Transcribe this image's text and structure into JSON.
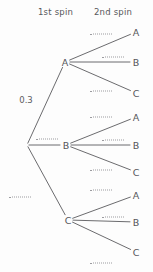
{
  "diagram": {
    "stage_width": 153,
    "stage_height": 272,
    "ink_color": "#5a5a5e",
    "blank_color": "#9b9b9f",
    "background": "#fdfdfd"
  },
  "headers": {
    "first": "1st spin",
    "second": "2nd spin"
  },
  "chart_data": {
    "type": "tree",
    "stage_width": 153,
    "stage_height": 272,
    "levels": [
      "1st spin",
      "2nd spin"
    ],
    "root": {
      "x": 27,
      "y": 145
    },
    "first_spin_nodes": [
      {
        "id": "A1",
        "label": "A",
        "x": 65,
        "y": 62
      },
      {
        "id": "B1",
        "label": "B",
        "x": 66,
        "y": 145
      },
      {
        "id": "C1",
        "label": "C",
        "x": 68,
        "y": 220
      }
    ],
    "second_spin_nodes": [
      {
        "id": "A1A",
        "label": "A",
        "x": 136,
        "y": 32,
        "parent": "A1"
      },
      {
        "id": "A1B",
        "label": "B",
        "x": 136,
        "y": 62,
        "parent": "A1"
      },
      {
        "id": "A1C",
        "label": "C",
        "x": 136,
        "y": 93,
        "parent": "A1"
      },
      {
        "id": "B1A",
        "label": "A",
        "x": 136,
        "y": 117,
        "parent": "B1"
      },
      {
        "id": "B1B",
        "label": "B",
        "x": 136,
        "y": 145,
        "parent": "B1"
      },
      {
        "id": "B1C",
        "label": "C",
        "x": 136,
        "y": 172,
        "parent": "B1"
      },
      {
        "id": "C1A",
        "label": "A",
        "x": 136,
        "y": 195,
        "parent": "C1"
      },
      {
        "id": "C1B",
        "label": "B",
        "x": 136,
        "y": 222,
        "parent": "C1"
      },
      {
        "id": "C1C",
        "label": "C",
        "x": 136,
        "y": 252,
        "parent": "C1"
      }
    ],
    "branches": [
      {
        "id": "r-A",
        "from": "root",
        "to": "A1",
        "label": "0.3",
        "filled": true,
        "label_x": 26,
        "label_y": 100
      },
      {
        "id": "r-B",
        "from": "root",
        "to": "B1",
        "label": "",
        "filled": false,
        "label_x": 47,
        "label_y": 139
      },
      {
        "id": "r-C",
        "from": "root",
        "to": "C1",
        "label": "",
        "filled": false,
        "label_x": 20,
        "label_y": 197
      },
      {
        "id": "A-A",
        "from": "A1",
        "to": "A1A",
        "label": "",
        "filled": false,
        "label_x": 101,
        "label_y": 34
      },
      {
        "id": "A-B",
        "from": "A1",
        "to": "A1B",
        "label": "",
        "filled": false,
        "label_x": 113,
        "label_y": 57
      },
      {
        "id": "A-C",
        "from": "A1",
        "to": "A1C",
        "label": "",
        "filled": false,
        "label_x": 101,
        "label_y": 91
      },
      {
        "id": "B-A",
        "from": "B1",
        "to": "B1A",
        "label": "",
        "filled": false,
        "label_x": 101,
        "label_y": 117
      },
      {
        "id": "B-B",
        "from": "B1",
        "to": "B1B",
        "label": "",
        "filled": false,
        "label_x": 113,
        "label_y": 140
      },
      {
        "id": "B-C",
        "from": "B1",
        "to": "B1C",
        "label": "",
        "filled": false,
        "label_x": 101,
        "label_y": 170
      },
      {
        "id": "C-A",
        "from": "C1",
        "to": "C1A",
        "label": "",
        "filled": false,
        "label_x": 101,
        "label_y": 190
      },
      {
        "id": "C-B",
        "from": "C1",
        "to": "C1B",
        "label": "",
        "filled": false,
        "label_x": 113,
        "label_y": 217
      },
      {
        "id": "C-C",
        "from": "C1",
        "to": "C1C",
        "label": "",
        "filled": false,
        "label_x": 101,
        "label_y": 263
      }
    ],
    "header_positions": {
      "first": {
        "x": 38,
        "y": 7
      },
      "second": {
        "x": 94,
        "y": 7
      }
    }
  }
}
